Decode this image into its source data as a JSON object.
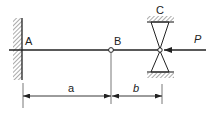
{
  "diagram": {
    "type": "beam-mechanics",
    "labels": {
      "A": "A",
      "B": "B",
      "C": "C",
      "P": "P"
    },
    "dimensions": {
      "a": "a",
      "b": "b"
    },
    "elements": {
      "fixed_support": "A",
      "hinge": "B",
      "roller_guide_support": "C",
      "load": "P",
      "load_direction": "left"
    },
    "colors": {
      "line": "#222222",
      "background": "#ffffff"
    }
  }
}
